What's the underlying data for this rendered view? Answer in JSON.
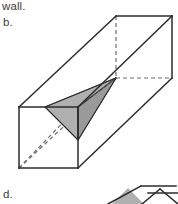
{
  "page": {
    "width": 178,
    "height": 204,
    "background": "#ffffff"
  },
  "captions": {
    "wall_text": "wall.",
    "choice_b_label": "b.",
    "choice_d_label": "d."
  },
  "colors": {
    "outline": "#2b2b2b",
    "hidden_edge": "#6e6e6e",
    "solid_fill": "#b0b0b0",
    "solid_fill_light": "#c2c2c2",
    "solid_fill_dark": "#9a9a9a",
    "box_face": "#ffffff",
    "text": "#3d3d3d"
  },
  "figure_b": {
    "name": "rectangular-prism-with-shaded-tetrahedron",
    "box": {
      "near_face": {
        "top_left": [
          19,
          107
        ],
        "top_right": [
          78,
          107
        ],
        "bottom_right": [
          78,
          168
        ],
        "bottom_left": [
          19,
          168
        ]
      },
      "far_face": {
        "top_left": [
          116,
          16
        ],
        "top_right": [
          172,
          16
        ],
        "bottom_right": [
          172,
          78
        ],
        "bottom_left": [
          116,
          78
        ]
      },
      "visible_connecting_edges": [
        [
          [
            19,
            107
          ],
          [
            116,
            16
          ]
        ],
        [
          [
            78,
            107
          ],
          [
            172,
            16
          ]
        ],
        [
          [
            78,
            168
          ],
          [
            172,
            78
          ]
        ]
      ],
      "hidden_connecting_edges": [
        [
          [
            19,
            168
          ],
          [
            116,
            78
          ]
        ]
      ],
      "hidden_face_edges": [
        [
          [
            116,
            16
          ],
          [
            116,
            78
          ]
        ],
        [
          [
            116,
            78
          ],
          [
            172,
            78
          ]
        ]
      ],
      "near_face_hidden_diagonal": [
        [
          19,
          168
        ],
        [
          78,
          107
        ]
      ]
    },
    "tetrahedron": {
      "vertex_left": [
        45,
        107
      ],
      "vertex_top_right": [
        78,
        107
      ],
      "vertex_bottom": [
        78,
        140
      ],
      "vertex_apex": [
        116,
        78
      ],
      "faces": [
        {
          "id": "upper-face",
          "points": [
            [
              45,
              107
            ],
            [
              78,
              107
            ],
            [
              116,
              78
            ]
          ]
        },
        {
          "id": "front-face",
          "points": [
            [
              45,
              107
            ],
            [
              78,
              140
            ],
            [
              116,
              78
            ]
          ]
        },
        {
          "id": "lower-face",
          "points": [
            [
              78,
              107
            ],
            [
              78,
              140
            ],
            [
              116,
              78
            ]
          ]
        }
      ],
      "internal_edge": [
        [
          78,
          107
        ],
        [
          78,
          140
        ]
      ]
    }
  },
  "figure_d": {
    "name": "partial-prism-cropped",
    "box_top_edge": [
      [
        110,
        204
      ],
      [
        142,
        186
      ],
      [
        178,
        186
      ]
    ],
    "shaded_points": [
      [
        112,
        204
      ],
      [
        128,
        188
      ],
      [
        144,
        204
      ]
    ],
    "visible_lines": [
      [
        [
          108,
          204
        ],
        [
          141,
          186
        ]
      ],
      [
        [
          141,
          186
        ],
        [
          176,
          186
        ]
      ],
      [
        [
          142,
          204
        ],
        [
          160,
          189
        ]
      ],
      [
        [
          160,
          189
        ],
        [
          178,
          204
        ]
      ],
      [
        [
          148,
          193
        ],
        [
          178,
          193
        ]
      ]
    ]
  }
}
